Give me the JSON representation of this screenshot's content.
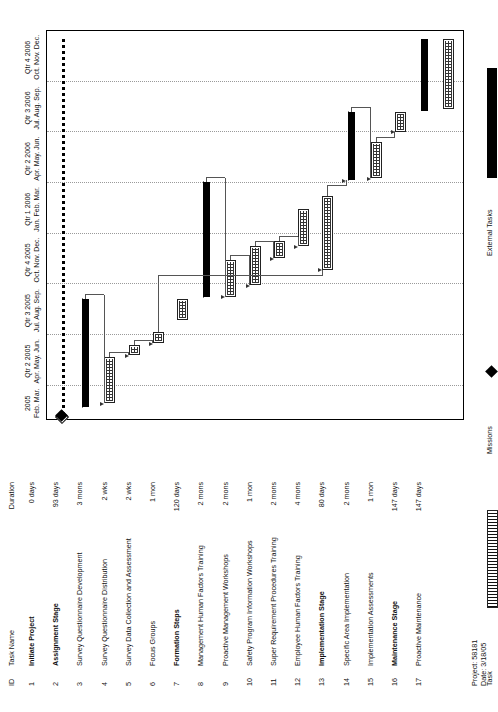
{
  "document": {
    "kind": "gantt-chart",
    "orientation": "landscape-rotated",
    "footer": {
      "project": "Project: 58181",
      "date": "Date: 3/18/05"
    }
  },
  "table": {
    "headers": {
      "id": "ID",
      "name": "Task Name",
      "duration": "Duration"
    },
    "rows": [
      {
        "id": "1",
        "name": "Initiate Project",
        "duration": "0 days",
        "bold": true
      },
      {
        "id": "2",
        "name": "Assignment Stage",
        "duration": "93 days",
        "bold": true
      },
      {
        "id": "3",
        "name": "Survey Questionnaire Development",
        "duration": "3 mons",
        "bold": false
      },
      {
        "id": "4",
        "name": "Survey Questionnaire Distribution",
        "duration": "2 wks",
        "bold": false
      },
      {
        "id": "5",
        "name": "Survey Data Collection and Assessment",
        "duration": "2 wks",
        "bold": false
      },
      {
        "id": "6",
        "name": "Focus Groups",
        "duration": "1 mon",
        "bold": false
      },
      {
        "id": "7",
        "name": "Formation Steps",
        "duration": "120 days",
        "bold": true
      },
      {
        "id": "8",
        "name": "Management Human Factors Training",
        "duration": "2 mons",
        "bold": false
      },
      {
        "id": "9",
        "name": "Proactive Management Workshops",
        "duration": "2 mons",
        "bold": false
      },
      {
        "id": "10",
        "name": "Safety Program Information Workshops",
        "duration": "1 mon",
        "bold": false
      },
      {
        "id": "11",
        "name": "Super Requirement Procedures Training",
        "duration": "2 mons",
        "bold": false
      },
      {
        "id": "12",
        "name": "Employee Human Factors Training",
        "duration": "4 mons",
        "bold": false
      },
      {
        "id": "13",
        "name": "Implementation Stage",
        "duration": "80 days",
        "bold": true
      },
      {
        "id": "14",
        "name": "Specific Area Implementation",
        "duration": "2 mons",
        "bold": false
      },
      {
        "id": "15",
        "name": "Implementation Assessments",
        "duration": "1 mon",
        "bold": false
      },
      {
        "id": "16",
        "name": "Maintenance Stage",
        "duration": "147 days",
        "bold": true
      },
      {
        "id": "17",
        "name": "Proactive Maintenance",
        "duration": "147 days",
        "bold": false
      }
    ]
  },
  "timeline": {
    "quarters": [
      {
        "label": "2005",
        "months": "Feb. Mar."
      },
      {
        "label": "Qtr 2 2005",
        "months": "Apr. May. Jun."
      },
      {
        "label": "Qtr 3 2005",
        "months": "Jul. Aug. Sep."
      },
      {
        "label": "Qtr 4 2005",
        "months": "Oct. Nov. Dec."
      },
      {
        "label": "Qtr 1 2006",
        "months": "Jan. Feb. Mar."
      },
      {
        "label": "Qtr 2 2006",
        "months": "Apr. May. Jun."
      },
      {
        "label": "Qtr 3 2006",
        "months": "Jul. Aug. Sep."
      },
      {
        "label": "Qtr 4 2006",
        "months": "Oct. Nov. Dec."
      }
    ]
  },
  "chart_data": {
    "type": "bar",
    "xlabel": "Timeline (Quarters 2005-2006)",
    "ylabel": "Task",
    "grid": true,
    "legend_position": "bottom",
    "categories": [
      "Initiate Project",
      "Assignment Stage",
      "Survey Questionnaire Development",
      "Survey Questionnaire Distribution",
      "Survey Data Collection and Assessment",
      "Focus Groups",
      "Formation Steps",
      "Management Human Factors Training",
      "Proactive Management Workshops",
      "Safety Program Information Workshops",
      "Super Requirement Procedures Training",
      "Employee Human Factors Training",
      "Implementation Stage",
      "Specific Area Implementation",
      "Implementation Assessments",
      "Maintenance Stage",
      "Proactive Maintenance"
    ],
    "values": [
      0,
      93,
      90,
      14,
      14,
      30,
      120,
      60,
      60,
      30,
      60,
      120,
      80,
      60,
      30,
      147,
      147
    ],
    "bars": [
      {
        "id": "1",
        "kind": "milestone",
        "start_pct": 1.0,
        "end_pct": 1.0
      },
      {
        "id": "2",
        "kind": "summary",
        "start_pct": 3.0,
        "end_pct": 31.0
      },
      {
        "id": "3",
        "kind": "task",
        "start_pct": 4.0,
        "end_pct": 16.0
      },
      {
        "id": "4",
        "kind": "task",
        "start_pct": 16.5,
        "end_pct": 19.0
      },
      {
        "id": "5",
        "kind": "task",
        "start_pct": 19.5,
        "end_pct": 22.5
      },
      {
        "id": "6",
        "kind": "task",
        "start_pct": 25.5,
        "end_pct": 31.0
      },
      {
        "id": "7",
        "kind": "summary",
        "start_pct": 31.5,
        "end_pct": 61.0
      },
      {
        "id": "8",
        "kind": "task",
        "start_pct": 31.5,
        "end_pct": 41.0
      },
      {
        "id": "9",
        "kind": "task",
        "start_pct": 34.5,
        "end_pct": 44.5
      },
      {
        "id": "10",
        "kind": "task",
        "start_pct": 41.5,
        "end_pct": 46.0
      },
      {
        "id": "11",
        "kind": "task",
        "start_pct": 44.5,
        "end_pct": 54.0
      },
      {
        "id": "12",
        "kind": "task",
        "start_pct": 38.5,
        "end_pct": 57.5
      },
      {
        "id": "13",
        "kind": "summary",
        "start_pct": 61.5,
        "end_pct": 79.0
      },
      {
        "id": "14",
        "kind": "task",
        "start_pct": 62.0,
        "end_pct": 71.5
      },
      {
        "id": "15",
        "kind": "task",
        "start_pct": 74.0,
        "end_pct": 79.0
      },
      {
        "id": "16",
        "kind": "extsum",
        "start_pct": 79.5,
        "end_pct": 98.0
      },
      {
        "id": "17",
        "kind": "task",
        "start_pct": 80.0,
        "end_pct": 98.0
      }
    ],
    "project_summary": {
      "start_pct": 1.0,
      "end_pct": 98.0
    },
    "deadline": {
      "start_pct": 0.2
    }
  },
  "legend": {
    "columns": [
      {
        "items": [
          {
            "label": "Task",
            "symbol": "task-bar"
          },
          {
            "label": "Split",
            "symbol": "split-bar"
          },
          {
            "label": "Progress",
            "symbol": "progress-bar"
          }
        ]
      },
      {
        "items": [
          {
            "label": "Missions",
            "symbol": "milestone-diamond"
          },
          {
            "label": "Summary",
            "symbol": "summary-bar"
          },
          {
            "label": "Project Summary",
            "symbol": "project-summary-bar"
          }
        ]
      },
      {
        "items": [
          {
            "label": "External Tasks",
            "symbol": "external-task-bar"
          },
          {
            "label": "External Missions",
            "symbol": "external-milestone-diamond"
          },
          {
            "label": "Deadline",
            "symbol": "deadline-diamond"
          }
        ]
      }
    ]
  },
  "colors": {
    "ink": "#000000",
    "grid": "#9a9a9a",
    "link": "#555555",
    "paper": "#ffffff"
  }
}
